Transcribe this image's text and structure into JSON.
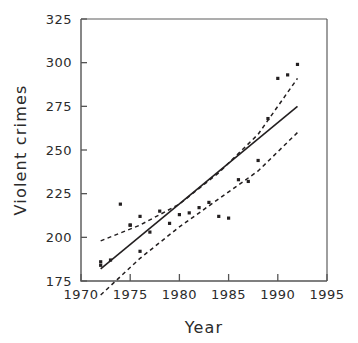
{
  "chart_data": {
    "type": "scatter",
    "title": "",
    "xlabel": "Year",
    "ylabel": "Violent  crimes",
    "xlim": [
      1970,
      1995
    ],
    "ylim": [
      175,
      325
    ],
    "xticks": [
      1970,
      1975,
      1980,
      1985,
      1990,
      1995
    ],
    "yticks": [
      175,
      200,
      225,
      250,
      275,
      300,
      325
    ],
    "grid": false,
    "legend": null,
    "series": [
      {
        "name": "Violent crimes observations",
        "type": "scatter",
        "marker": "square",
        "color": "#231f20",
        "points": [
          {
            "x": 1972,
            "y": 186
          },
          {
            "x": 1972,
            "y": 184
          },
          {
            "x": 1973,
            "y": 187
          },
          {
            "x": 1974,
            "y": 219
          },
          {
            "x": 1975,
            "y": 207
          },
          {
            "x": 1975,
            "y": 207
          },
          {
            "x": 1976,
            "y": 192
          },
          {
            "x": 1976,
            "y": 212
          },
          {
            "x": 1977,
            "y": 203
          },
          {
            "x": 1978,
            "y": 215
          },
          {
            "x": 1979,
            "y": 208
          },
          {
            "x": 1980,
            "y": 213
          },
          {
            "x": 1981,
            "y": 214
          },
          {
            "x": 1982,
            "y": 217
          },
          {
            "x": 1983,
            "y": 220
          },
          {
            "x": 1984,
            "y": 212
          },
          {
            "x": 1985,
            "y": 211
          },
          {
            "x": 1986,
            "y": 233
          },
          {
            "x": 1987,
            "y": 232
          },
          {
            "x": 1988,
            "y": 244
          },
          {
            "x": 1989,
            "y": 268
          },
          {
            "x": 1990,
            "y": 291
          },
          {
            "x": 1991,
            "y": 293
          },
          {
            "x": 1992,
            "y": 299
          }
        ]
      },
      {
        "name": "Regression line",
        "type": "line",
        "style": "solid",
        "color": "#231f20",
        "points": [
          {
            "x": 1972,
            "y": 182
          },
          {
            "x": 1992,
            "y": 275
          }
        ]
      },
      {
        "name": "Upper confidence band",
        "type": "line",
        "style": "dashed",
        "color": "#231f20",
        "points": [
          {
            "x": 1972,
            "y": 198
          },
          {
            "x": 1976,
            "y": 207
          },
          {
            "x": 1980,
            "y": 219
          },
          {
            "x": 1984,
            "y": 237
          },
          {
            "x": 1988,
            "y": 259
          },
          {
            "x": 1992,
            "y": 291
          }
        ]
      },
      {
        "name": "Lower confidence band",
        "type": "line",
        "style": "dashed",
        "color": "#231f20",
        "points": [
          {
            "x": 1972,
            "y": 167
          },
          {
            "x": 1976,
            "y": 188
          },
          {
            "x": 1980,
            "y": 206
          },
          {
            "x": 1984,
            "y": 222
          },
          {
            "x": 1988,
            "y": 238
          },
          {
            "x": 1992,
            "y": 260
          }
        ]
      }
    ]
  },
  "axis": {
    "x_title": "Year",
    "y_title": "Violent  crimes",
    "x_tick_labels": [
      "1970",
      "1975",
      "1980",
      "1985",
      "1990",
      "1995"
    ],
    "y_tick_labels": [
      "175",
      "200",
      "225",
      "250",
      "275",
      "300",
      "325"
    ]
  },
  "colors": {
    "background": "#ffffff",
    "ink": "#231f20",
    "axis": "#555555"
  }
}
